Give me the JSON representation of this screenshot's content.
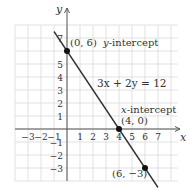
{
  "chart_data": {
    "type": "line",
    "title": "",
    "xlabel": "x",
    "ylabel": "y",
    "equation": "3x + 2y = 12",
    "xlim": [
      -4,
      8.5
    ],
    "ylim": [
      -4,
      8
    ],
    "grid": true,
    "x_ticks": [
      -3,
      -2,
      -1,
      1,
      2,
      3,
      4,
      5,
      6,
      7
    ],
    "x_tick_labels": [
      "−3",
      "−2",
      "−1",
      "1",
      "2",
      "3",
      "4",
      "5",
      "6",
      "7"
    ],
    "y_ticks": [
      -3,
      -2,
      -1,
      1,
      2,
      3,
      4,
      5,
      7
    ],
    "y_tick_labels": [
      "−3",
      "−2",
      "−1",
      "1",
      "2",
      "3",
      "4",
      "5",
      "7"
    ],
    "line": {
      "x1": -1,
      "y1": 7.5,
      "x2": 7,
      "y2": -4.5
    },
    "points": [
      {
        "x": 0,
        "y": 6,
        "label": "(0, 6)",
        "annotation": "y-intercept"
      },
      {
        "x": 4,
        "y": 0,
        "label": "(4, 0)",
        "annotation": "x-intercept"
      },
      {
        "x": 6,
        "y": -3,
        "label": "(6, −3)",
        "annotation": ""
      }
    ]
  },
  "labels": {
    "axis_x": "x",
    "axis_y": "y",
    "equation": "3x + 2y = 12",
    "pt1": "(0, 6)",
    "pt1_note_var": "y",
    "pt1_note": "-intercept",
    "pt2_note_var": "x",
    "pt2_note": "-intercept",
    "pt2": "(4, 0)",
    "pt3": "(6, −3)"
  },
  "colors": {
    "grid": "#d9d9d9",
    "axis": "#555555",
    "line": "#333333",
    "point": "#111111",
    "text": "#333333"
  }
}
